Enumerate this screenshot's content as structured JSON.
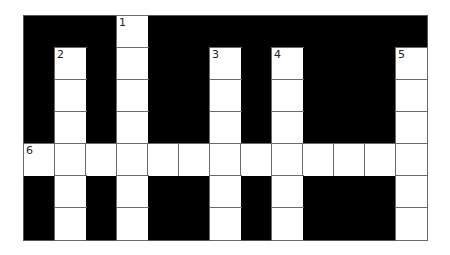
{
  "puzzle": {
    "rows": 7,
    "cols": 13,
    "colors": {
      "block": "#000000",
      "cell": "#ffffff",
      "line": "#6a6a6a"
    },
    "layout": [
      "###.#########",
      "#.#.##.#.###.",
      "#.#.##.#.###.",
      "#.#.##.#.###.",
      ".............",
      "#.#.##.#.###.",
      "#.#.##.#.###."
    ],
    "numbers": [
      {
        "row": 0,
        "col": 3,
        "label": "1"
      },
      {
        "row": 1,
        "col": 1,
        "label": "2"
      },
      {
        "row": 1,
        "col": 6,
        "label": "3"
      },
      {
        "row": 1,
        "col": 8,
        "label": "4"
      },
      {
        "row": 1,
        "col": 12,
        "label": "5"
      },
      {
        "row": 4,
        "col": 0,
        "label": "6"
      }
    ],
    "entries": [
      {
        "number": "1",
        "direction": "down",
        "row": 0,
        "col": 3,
        "length": 7
      },
      {
        "number": "2",
        "direction": "down",
        "row": 1,
        "col": 1,
        "length": 6
      },
      {
        "number": "3",
        "direction": "down",
        "row": 1,
        "col": 6,
        "length": 6
      },
      {
        "number": "4",
        "direction": "down",
        "row": 1,
        "col": 8,
        "length": 6
      },
      {
        "number": "5",
        "direction": "down",
        "row": 1,
        "col": 12,
        "length": 6
      },
      {
        "number": "6",
        "direction": "across",
        "row": 4,
        "col": 0,
        "length": 13
      }
    ]
  }
}
